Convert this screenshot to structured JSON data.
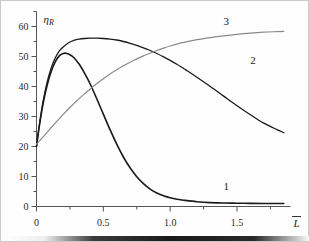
{
  "figure": {
    "background_color": "#fefefe",
    "border_color": "#c9c9c9",
    "axis_color": "#555555"
  },
  "chart_data": {
    "type": "line",
    "title": "",
    "subtitle": "",
    "xlabel": "L̄",
    "ylabel": "η",
    "ylabel_sub": "R",
    "xlim": [
      0,
      1.9
    ],
    "ylim": [
      0,
      65
    ],
    "grid": false,
    "legend_position": "inline-curve-labels",
    "xticks": [
      0,
      0.5,
      1.0,
      1.5
    ],
    "xtick_labels": [
      "0",
      "0.5",
      "1.0",
      "1.5"
    ],
    "xminor_step": 0.25,
    "yticks": [
      0,
      10,
      20,
      30,
      40,
      50,
      60
    ],
    "ytick_labels": [
      "0",
      "10",
      "20",
      "30",
      "40",
      "50",
      "60"
    ],
    "yminor_step": 5,
    "series": [
      {
        "name": "1",
        "label": "1",
        "color": "#1a1a1a",
        "width": 1.6,
        "label_x": 1.42,
        "label_y": 5.5,
        "x": [
          0,
          0.02,
          0.05,
          0.08,
          0.11,
          0.14,
          0.17,
          0.2,
          0.22,
          0.25,
          0.28,
          0.32,
          0.36,
          0.4,
          0.45,
          0.5,
          0.55,
          0.6,
          0.65,
          0.7,
          0.75,
          0.8,
          0.85,
          0.9,
          0.95,
          1.0,
          1.05,
          1.1,
          1.2,
          1.3,
          1.4,
          1.5,
          1.6,
          1.7,
          1.8,
          1.85
        ],
        "y": [
          20.0,
          26.5,
          34.5,
          40.5,
          45.0,
          48.2,
          50.2,
          51.0,
          51.1,
          50.6,
          49.6,
          47.4,
          44.4,
          41.0,
          36.0,
          30.8,
          25.6,
          20.8,
          16.5,
          12.9,
          9.9,
          7.6,
          5.8,
          4.5,
          3.6,
          2.9,
          2.4,
          2.1,
          1.6,
          1.3,
          1.15,
          1.1,
          1.05,
          1.0,
          1.0,
          1.0
        ]
      },
      {
        "name": "2",
        "label": "2",
        "color": "#1a1a1a",
        "width": 1.3,
        "label_x": 1.62,
        "label_y": 47.5,
        "x": [
          0,
          0.02,
          0.05,
          0.08,
          0.11,
          0.14,
          0.17,
          0.2,
          0.24,
          0.28,
          0.32,
          0.36,
          0.4,
          0.45,
          0.5,
          0.55,
          0.6,
          0.65,
          0.7,
          0.75,
          0.8,
          0.85,
          0.9,
          0.95,
          1.0,
          1.05,
          1.1,
          1.15,
          1.2,
          1.3,
          1.4,
          1.5,
          1.6,
          1.7,
          1.8,
          1.85
        ],
        "y": [
          20.0,
          26.8,
          35.2,
          41.5,
          46.2,
          49.5,
          51.8,
          53.2,
          54.6,
          55.4,
          55.8,
          56.0,
          56.1,
          56.1,
          56.0,
          55.8,
          55.5,
          55.0,
          54.4,
          53.7,
          52.9,
          52.0,
          51.0,
          49.9,
          48.7,
          47.4,
          46.0,
          44.6,
          43.1,
          40.0,
          36.8,
          33.6,
          30.6,
          27.8,
          25.6,
          24.6
        ]
      },
      {
        "name": "3",
        "label": "3",
        "color": "#8a8a8a",
        "width": 1.2,
        "label_x": 1.42,
        "label_y": 60.5,
        "x": [
          0,
          0.05,
          0.1,
          0.15,
          0.2,
          0.25,
          0.3,
          0.35,
          0.4,
          0.45,
          0.5,
          0.55,
          0.6,
          0.65,
          0.7,
          0.75,
          0.8,
          0.85,
          0.9,
          0.95,
          1.0,
          1.1,
          1.2,
          1.3,
          1.4,
          1.5,
          1.6,
          1.7,
          1.8,
          1.85
        ],
        "y": [
          20.8,
          23.2,
          25.8,
          28.3,
          30.7,
          33.0,
          35.2,
          37.2,
          39.1,
          40.9,
          42.6,
          44.2,
          45.6,
          46.9,
          48.1,
          49.2,
          50.2,
          51.1,
          52.0,
          52.8,
          53.5,
          54.7,
          55.6,
          56.3,
          56.9,
          57.4,
          57.8,
          58.1,
          58.3,
          58.4
        ]
      }
    ]
  }
}
